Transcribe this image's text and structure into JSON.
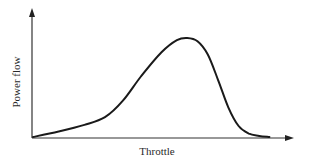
{
  "chart_data": {
    "type": "line",
    "title": "",
    "xlabel": "Throttle",
    "ylabel": "Power flow",
    "grid": false,
    "legend": null,
    "ticks": {
      "x": [],
      "y": []
    },
    "xlim": [
      0,
      1
    ],
    "ylim": [
      0,
      1
    ],
    "series": [
      {
        "name": "Power flow vs throttle",
        "x": [
          0.0,
          0.1,
          0.2,
          0.28,
          0.35,
          0.42,
          0.5,
          0.56,
          0.6,
          0.64,
          0.68,
          0.72,
          0.76,
          0.8,
          0.84,
          0.88,
          0.92
        ],
        "y": [
          0.0,
          0.05,
          0.11,
          0.18,
          0.33,
          0.55,
          0.77,
          0.88,
          0.9,
          0.87,
          0.75,
          0.52,
          0.27,
          0.1,
          0.03,
          0.01,
          0.0
        ]
      }
    ],
    "annotations": []
  },
  "labels": {
    "x_axis": "Throttle",
    "y_axis": "Power flow"
  },
  "colors": {
    "axis": "#333333",
    "curve": "#1a1a1a",
    "text": "#2a2a2a",
    "background": "#ffffff"
  }
}
